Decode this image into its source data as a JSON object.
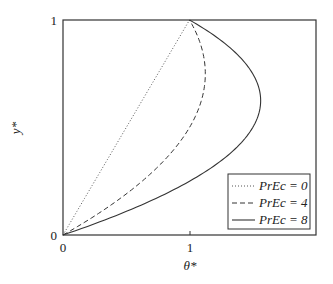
{
  "chart_data": {
    "type": "line",
    "title": "",
    "xlabel": "θ*",
    "ylabel": "y*",
    "xlim": [
      0,
      2
    ],
    "ylim": [
      0,
      1
    ],
    "xticks": [
      "0",
      "1"
    ],
    "yticks": [
      "0",
      "1"
    ],
    "grid": false,
    "legend_position": "lower right",
    "series": [
      {
        "name": "PrEc = 0",
        "style": "dotted",
        "PrEc": 0,
        "y": [
          0,
          0.125,
          0.25,
          0.375,
          0.5,
          0.625,
          0.75,
          0.875,
          1
        ],
        "x": [
          0,
          0.125,
          0.25,
          0.375,
          0.5,
          0.625,
          0.75,
          0.875,
          1
        ]
      },
      {
        "name": "PrEc = 4",
        "style": "dashed",
        "PrEc": 4,
        "y": [
          0,
          0.125,
          0.25,
          0.375,
          0.5,
          0.625,
          0.75,
          0.875,
          1
        ],
        "x": [
          0,
          0.344,
          0.625,
          0.844,
          1.0,
          1.094,
          1.125,
          1.094,
          1
        ]
      },
      {
        "name": "PrEc = 8",
        "style": "solid",
        "PrEc": 8,
        "y": [
          0,
          0.125,
          0.25,
          0.375,
          0.5,
          0.625,
          0.75,
          0.875,
          1
        ],
        "x": [
          0,
          0.5625,
          1.0,
          1.3125,
          1.5,
          1.5625,
          1.5,
          1.3125,
          1
        ]
      }
    ]
  },
  "labels": {
    "x_tick_0": "0",
    "x_tick_1": "1",
    "y_tick_0": "0",
    "y_tick_1": "1",
    "xlabel": "θ*",
    "ylabel": "y*"
  },
  "legend": [
    {
      "label": "PrEc = 0"
    },
    {
      "label": "PrEc = 4"
    },
    {
      "label": "PrEc = 8"
    }
  ]
}
